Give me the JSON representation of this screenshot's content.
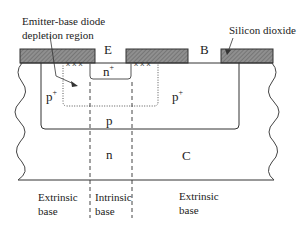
{
  "diagram": {
    "annotations": {
      "depletion_line1": "Emitter-base diode",
      "depletion_line2": "depletion region",
      "oxide": "Silicon dioxide"
    },
    "terminals": {
      "emitter": "E",
      "base": "B",
      "collector": "C"
    },
    "regions": {
      "emitter_n": "n",
      "emitter_sup": "+",
      "p_plus_left": "p",
      "p_plus_left_sup": "+",
      "p_plus_right": "p",
      "p_plus_right_sup": "+",
      "p_base": "p",
      "n_collector": "n"
    },
    "bottom_labels": {
      "extrinsic_left_1": "Extrinsic",
      "extrinsic_left_2": "base",
      "intrinsic_1": "Intrinsic",
      "intrinsic_2": "base",
      "extrinsic_right_1": "Extrinsic",
      "extrinsic_right_2": "base"
    },
    "colors": {
      "oxide_fill": "#8a8a8a",
      "line": "#333333"
    }
  }
}
